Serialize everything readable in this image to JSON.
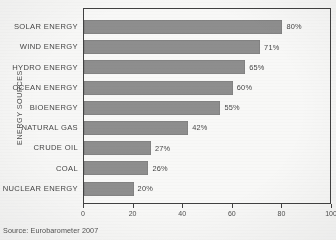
{
  "chart_data": {
    "type": "bar",
    "orientation": "horizontal",
    "title": "",
    "xlabel": "",
    "ylabel": "ENERGY SOURCES",
    "xlim": [
      0,
      100
    ],
    "xticks": [
      0,
      20,
      40,
      60,
      80,
      100
    ],
    "grid": false,
    "legend": null,
    "bar_color": "#8d8d8d",
    "categories": [
      "SOLAR ENERGY",
      "WIND ENERGY",
      "HYDRO ENERGY",
      "OCEAN ENERGY",
      "BIOENERGY",
      "NATURAL GAS",
      "CRUDE OIL",
      "COAL",
      "NUCLEAR ENERGY"
    ],
    "values": [
      80,
      71,
      65,
      60,
      55,
      42,
      27,
      26,
      20
    ],
    "value_labels": [
      "80%",
      "71%",
      "65%",
      "60%",
      "55%",
      "42%",
      "27%",
      "26%",
      "20%"
    ]
  },
  "source_note": "Source: Eurobarometer 2007"
}
